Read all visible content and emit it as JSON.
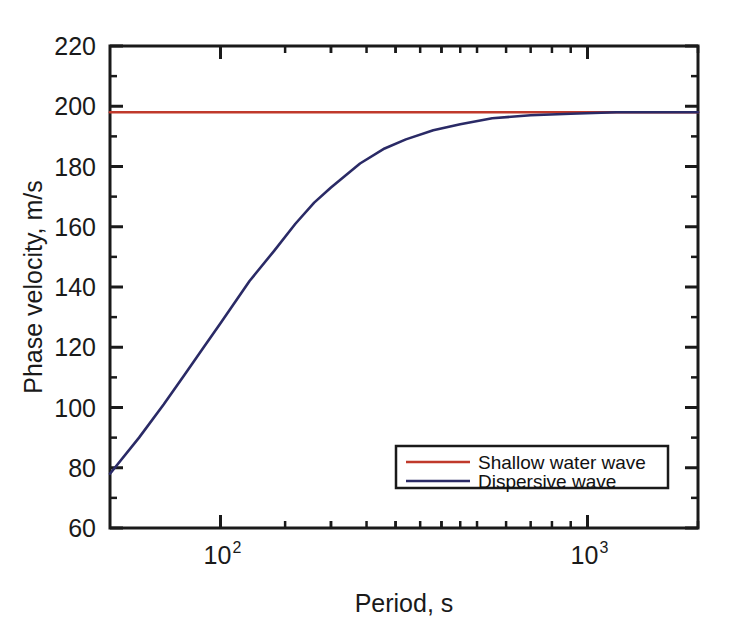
{
  "chart_data": {
    "type": "line",
    "title": "",
    "xlabel": "Period, s",
    "ylabel": "Phase velocity, m/s",
    "xscale": "log",
    "yscale": "linear",
    "xlim": [
      50,
      2000
    ],
    "ylim": [
      60,
      220
    ],
    "ytick_labels": [
      "220",
      "200",
      "180",
      "160",
      "140",
      "120",
      "100",
      "80",
      "60"
    ],
    "ytick_values": [
      220,
      200,
      180,
      160,
      140,
      120,
      100,
      80,
      60
    ],
    "ytick_minor_step": 10,
    "xtick_labels": [
      "10",
      "10"
    ],
    "xtick_exponents": [
      "2",
      "3"
    ],
    "xtick_values": [
      100,
      1000
    ],
    "grid": false,
    "legend_position": "lower right",
    "series": [
      {
        "name": "Shallow water wave",
        "color": "#c0392b",
        "x": [
          50,
          2000
        ],
        "values": [
          198,
          198
        ]
      },
      {
        "name": "Dispersive wave",
        "color": "#2a2a66",
        "x": [
          50,
          60,
          70,
          80,
          90,
          100,
          120,
          140,
          160,
          180,
          200,
          240,
          280,
          320,
          380,
          450,
          550,
          700,
          900,
          1200,
          1600,
          2000
        ],
        "values": [
          78,
          90,
          101,
          111,
          120,
          128,
          142,
          152,
          161,
          168,
          173,
          181,
          186,
          189,
          192,
          194,
          196,
          197,
          197.5,
          198,
          198,
          198
        ]
      }
    ]
  },
  "axes": {
    "y_axis_title": "Phase velocity, m/s",
    "x_axis_title": "Period, s"
  },
  "legend": {
    "entries": [
      {
        "label": "Shallow water wave",
        "color": "#c0392b"
      },
      {
        "label": "Dispersive wave",
        "color": "#2a2a66"
      }
    ]
  },
  "colors": {
    "shallow_water_wave": "#c0392b",
    "dispersive_wave": "#2a2a66",
    "axis": "#1a1a1a",
    "background": "#ffffff"
  }
}
